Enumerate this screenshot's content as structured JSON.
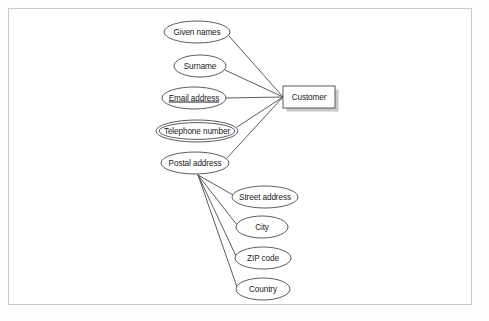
{
  "diagram": {
    "type": "entity-relationship-diagram",
    "title": "",
    "background_color": "#fdfdfd",
    "frame_color": "#c9c9c9",
    "stroke_color": "#4a4a4a",
    "text_color": "#1a1a1a",
    "shadow_color": "#9a9a9a",
    "entity": {
      "label": "Customer",
      "shape": "rectangle",
      "x": 309,
      "y": 97,
      "width": 52,
      "height": 22,
      "has_shadow": true
    },
    "attributes": [
      {
        "label": "Given names",
        "shape": "ellipse",
        "x": 197,
        "y": 32,
        "rx": 33,
        "ry": 11,
        "key": false,
        "multivalued": false,
        "composite": false
      },
      {
        "label": "Surname",
        "shape": "ellipse",
        "x": 200,
        "y": 66,
        "rx": 26,
        "ry": 11,
        "key": false,
        "multivalued": false,
        "composite": false
      },
      {
        "label": "Email address",
        "shape": "ellipse",
        "x": 194,
        "y": 98,
        "rx": 32,
        "ry": 11,
        "key": true,
        "multivalued": false,
        "composite": false
      },
      {
        "label": "Telephone number",
        "shape": "double-ellipse",
        "x": 197,
        "y": 131,
        "rx": 41,
        "ry": 11,
        "key": false,
        "multivalued": true,
        "composite": false
      },
      {
        "label": "Postal address",
        "shape": "ellipse",
        "x": 195,
        "y": 163,
        "rx": 34,
        "ry": 11,
        "key": false,
        "multivalued": false,
        "composite": true
      }
    ],
    "sub_attributes": [
      {
        "label": "Street address",
        "shape": "ellipse",
        "x": 265,
        "y": 197,
        "rx": 33,
        "ry": 11,
        "parent": "Postal address"
      },
      {
        "label": "City",
        "shape": "ellipse",
        "x": 262,
        "y": 227,
        "rx": 26,
        "ry": 11,
        "parent": "Postal address"
      },
      {
        "label": "ZIP code",
        "shape": "ellipse",
        "x": 263,
        "y": 258,
        "rx": 28,
        "ry": 11,
        "parent": "Postal address"
      },
      {
        "label": "Country",
        "shape": "ellipse",
        "x": 263,
        "y": 289,
        "rx": 27,
        "ry": 11,
        "parent": "Postal address"
      }
    ],
    "edges": [
      {
        "from": "Given names",
        "to": "Customer",
        "x1": 229,
        "y1": 36,
        "x2": 283,
        "y2": 97
      },
      {
        "from": "Surname",
        "to": "Customer",
        "x1": 225,
        "y1": 70,
        "x2": 283,
        "y2": 97
      },
      {
        "from": "Email address",
        "to": "Customer",
        "x1": 226,
        "y1": 98,
        "x2": 283,
        "y2": 97
      },
      {
        "from": "Telephone number",
        "to": "Customer",
        "x1": 237,
        "y1": 127,
        "x2": 283,
        "y2": 97
      },
      {
        "from": "Postal address",
        "to": "Customer",
        "x1": 227,
        "y1": 158,
        "x2": 283,
        "y2": 97
      },
      {
        "from": "Postal address",
        "to": "Street address",
        "x1": 198,
        "y1": 175,
        "x2": 233,
        "y2": 195
      },
      {
        "from": "Postal address",
        "to": "City",
        "x1": 198,
        "y1": 175,
        "x2": 237,
        "y2": 225
      },
      {
        "from": "Postal address",
        "to": "ZIP code",
        "x1": 198,
        "y1": 175,
        "x2": 236,
        "y2": 256
      },
      {
        "from": "Postal address",
        "to": "Country",
        "x1": 198,
        "y1": 175,
        "x2": 237,
        "y2": 287
      }
    ]
  }
}
